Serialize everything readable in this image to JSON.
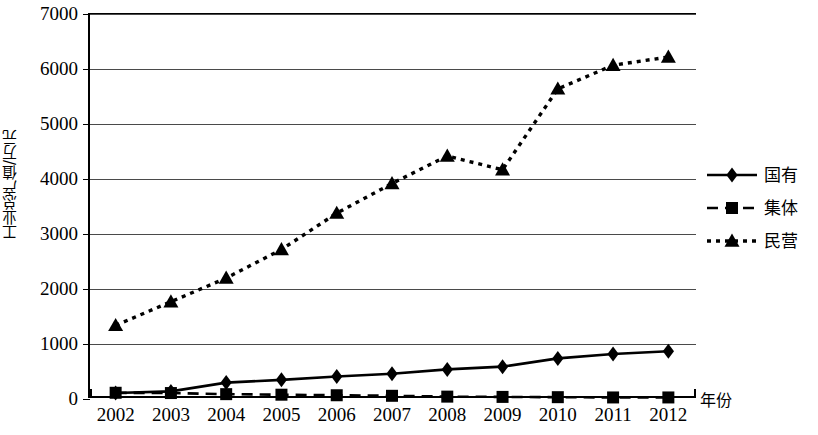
{
  "chart_data": {
    "type": "line",
    "title": "",
    "xlabel": "年份",
    "ylabel": "工业总产值/万元",
    "categories": [
      "2002",
      "2003",
      "2004",
      "2005",
      "2006",
      "2007",
      "2008",
      "2009",
      "2010",
      "2011",
      "2012"
    ],
    "ylim": [
      0,
      7000
    ],
    "y_ticks": [
      0,
      1000,
      2000,
      3000,
      4000,
      5000,
      6000,
      7000
    ],
    "grid": true,
    "legend_position": "right",
    "series": [
      {
        "name": "国有",
        "marker": "diamond",
        "line_style": "solid",
        "color": "#000000",
        "values": [
          90,
          120,
          280,
          330,
          390,
          440,
          520,
          570,
          720,
          800,
          850
        ]
      },
      {
        "name": "集体",
        "marker": "square",
        "line_style": "dashed",
        "color": "#000000",
        "values": [
          95,
          90,
          70,
          60,
          50,
          40,
          25,
          20,
          15,
          10,
          10
        ]
      },
      {
        "name": "民营",
        "marker": "triangle",
        "line_style": "dotted",
        "color": "#000000",
        "values": [
          1320,
          1750,
          2180,
          2700,
          3360,
          3900,
          4400,
          4150,
          5620,
          6050,
          6200
        ]
      }
    ]
  },
  "axes": {
    "y_tick_labels": [
      "7000",
      "6000",
      "5000",
      "4000",
      "3000",
      "2000",
      "1000",
      "0"
    ],
    "y_title": "工业总产值/万元",
    "x_tick_labels": [
      "2002",
      "2003",
      "2004",
      "2005",
      "2006",
      "2007",
      "2008",
      "2009",
      "2010",
      "2011",
      "2012"
    ],
    "x_title": "年份"
  },
  "legend": {
    "items": [
      {
        "label": "国有",
        "marker": "diamond",
        "line_style": "solid"
      },
      {
        "label": "集体",
        "marker": "square",
        "line_style": "dashed"
      },
      {
        "label": "民营",
        "marker": "triangle",
        "line_style": "dotted"
      }
    ]
  }
}
